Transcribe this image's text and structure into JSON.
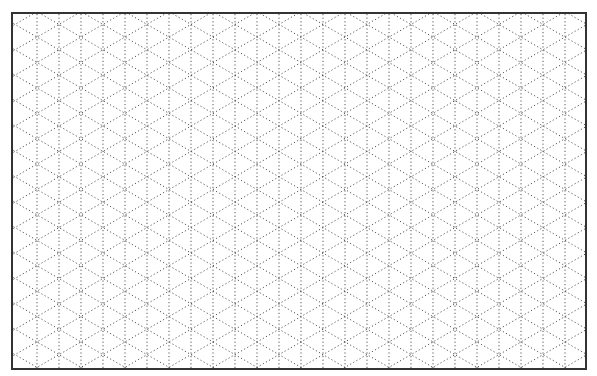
{
  "diagram": {
    "type": "isometric-grid-paper",
    "line_style": "dotted",
    "line_color": "#555555",
    "border_color": "#333333",
    "background": "#ffffff",
    "vertical_spacing_px": 22,
    "angle_deg": 60
  }
}
